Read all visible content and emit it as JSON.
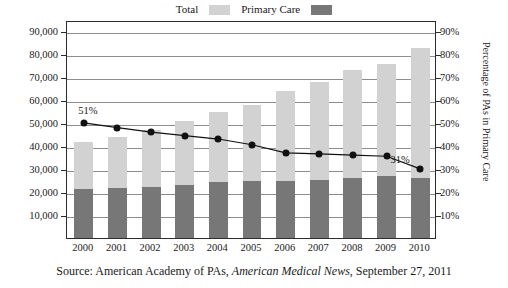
{
  "legend": {
    "items": [
      {
        "label": "Total",
        "color": "#d2d2d2"
      },
      {
        "label": "Primary Care",
        "color": "#777777"
      }
    ]
  },
  "axes": {
    "left_title": "Number of PAs",
    "right_title": "Percentage of PAs in Primary Care",
    "left_ticks": [
      "10,000",
      "20,000",
      "30,000",
      "40,000",
      "50,000",
      "60,000",
      "70,000",
      "80,000",
      "90,000"
    ],
    "right_ticks": [
      "10%",
      "20%",
      "30%",
      "40%",
      "50%",
      "60%",
      "70%",
      "80%",
      "90%"
    ]
  },
  "annotations": {
    "first_point": "51%",
    "last_point": "31%"
  },
  "source": {
    "prefix": "Source: American Academy of PAs, ",
    "italic": "American Medical News",
    "suffix": ", September 27, 2011"
  },
  "chart_data": {
    "type": "bar",
    "title": "",
    "xlabel": "",
    "ylabel": "Number of PAs",
    "y2label": "Percentage of PAs in Primary Care",
    "categories": [
      "2000",
      "2001",
      "2002",
      "2003",
      "2004",
      "2005",
      "2006",
      "2007",
      "2008",
      "2009",
      "2010"
    ],
    "ylim": [
      0,
      95000
    ],
    "y2lim": [
      0,
      95
    ],
    "grid": true,
    "legend_position": "top-center",
    "series": [
      {
        "name": "Total",
        "type": "bar",
        "axis": "left",
        "color": "#d2d2d2",
        "values": [
          42000,
          44000,
          47000,
          51000,
          55000,
          58000,
          64000,
          68000,
          73000,
          76000,
          83000
        ]
      },
      {
        "name": "Primary Care",
        "type": "bar",
        "axis": "left",
        "color": "#777777",
        "stacked_within_total": true,
        "values": [
          21400,
          21600,
          22100,
          23000,
          24200,
          24700,
          24800,
          25500,
          26000,
          27000,
          26000
        ]
      },
      {
        "name": "Percentage of PAs in Primary Care",
        "type": "line",
        "axis": "right",
        "color": "#111111",
        "values": [
          51,
          49,
          47,
          45.5,
          44,
          41.5,
          38,
          37.5,
          37,
          36.5,
          31
        ]
      }
    ]
  }
}
